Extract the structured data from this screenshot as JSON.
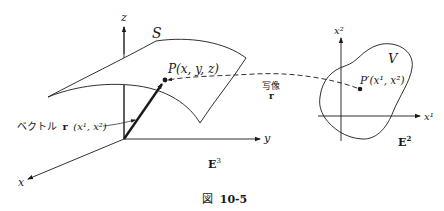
{
  "figure": {
    "caption_prefix": "図",
    "caption_number": "10-5"
  },
  "left_space": {
    "name": "E",
    "superscript": "3",
    "surface_label": "S",
    "point_label": "P(x, y, z)",
    "axes": {
      "z": "z",
      "y": "y",
      "x": "x"
    },
    "vector_label_jp": "ベクトル",
    "vector_symbol": "r",
    "vector_args": "(x¹, x²)"
  },
  "right_space": {
    "name": "E",
    "superscript": "2",
    "region_label": "V",
    "point_label": "P′(x¹, x²)",
    "axes": {
      "x1": "x¹",
      "x2": "x²"
    }
  },
  "mapping": {
    "label_jp": "写像",
    "symbol": "r"
  },
  "colors": {
    "ink": "#1a1a1a",
    "background": "#ffffff"
  }
}
